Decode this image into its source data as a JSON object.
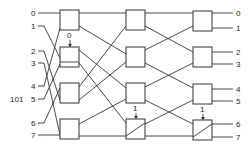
{
  "diagram": {
    "type": "multistage-interconnection-network",
    "stages": 3,
    "switches_per_stage": 4,
    "inputs": [
      "0",
      "1",
      "2",
      "3",
      "4",
      "5",
      "6",
      "7"
    ],
    "outputs": [
      "0",
      "1",
      "2",
      "3",
      "4",
      "5",
      "6",
      "7"
    ],
    "source_address_label": "101",
    "control_bits": [
      {
        "stage": 1,
        "switch": 2,
        "value": "0"
      },
      {
        "stage": 2,
        "switch": 4,
        "value": "1"
      },
      {
        "stage": 3,
        "switch": 4,
        "value": "1"
      }
    ]
  },
  "colors": {
    "line": "#333333",
    "background": "#ffffff"
  }
}
